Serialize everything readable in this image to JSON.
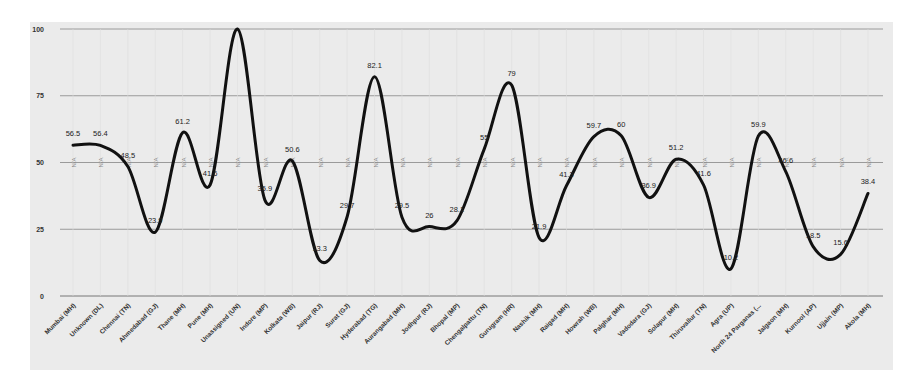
{
  "chart_data": {
    "type": "line",
    "title": "",
    "xlabel": "",
    "ylabel": "",
    "ylim": [
      0,
      100
    ],
    "yticks": [
      0,
      25,
      50,
      75,
      100
    ],
    "grid": true,
    "legend": "none",
    "smooth": true,
    "categories": [
      "Mumbai (MH)",
      "Unknown (DL)",
      "Chennai (TN)",
      "Ahmedabad (GJ)",
      "Thane (MH)",
      "Pune (MH)",
      "Unassigned (UN)",
      "Indore (MP)",
      "Kolkata (WB)",
      "Jaipur (RJ)",
      "Surat (GJ)",
      "Hyderabad (TG)",
      "Aurangabad (MH)",
      "Jodhpur (RJ)",
      "Bhopal (MP)",
      "Chengalpattu (TN)",
      "Gurugram (HR)",
      "Nashik (MH)",
      "Raigad (MH)",
      "Howrah (WB)",
      "Palghar (MH)",
      "Vadodara (GJ)",
      "Solapur (MH)",
      "Thiruvallur (TN)",
      "Agra (UP)",
      "North 24 Parganas (...",
      "Jalgaon (MH)",
      "Kurnool (AP)",
      "Ujjain (MP)",
      "Akola (MH)"
    ],
    "series": [
      {
        "name": "value",
        "color": "#111111",
        "values": [
          56.5,
          56.4,
          48.5,
          23.9,
          61.2,
          41.6,
          100,
          35.9,
          50.6,
          13.3,
          29.7,
          82.1,
          29.5,
          26,
          28.1,
          55,
          79,
          21.9,
          41.3,
          59.7,
          60,
          36.9,
          51.2,
          41.6,
          10.2,
          59.9,
          46.6,
          18.5,
          15.6,
          38.4
        ],
        "labels": [
          "56.5",
          "56.4",
          "48.5",
          "23.9",
          "61.2",
          "41.6",
          "",
          "35.9",
          "50.6",
          "13.3",
          "29.7",
          "82.1",
          "29.5",
          "26",
          "28.1",
          "55",
          "79",
          "21.9",
          "41.3",
          "59.7",
          "60",
          "36.9",
          "51.2",
          "41.6",
          "10.2",
          "59.9",
          "46.6",
          "18.5",
          "15.6",
          "38.4"
        ]
      },
      {
        "name": "missing",
        "color": "#8a8a8a",
        "values": [
          null,
          null,
          null,
          null,
          null,
          null,
          null,
          null,
          null,
          null,
          null,
          null,
          null,
          null,
          null,
          null,
          null,
          null,
          null,
          null,
          null,
          null,
          null,
          null,
          null,
          null,
          null,
          null,
          null,
          null
        ],
        "null_label": "N/A"
      }
    ]
  }
}
